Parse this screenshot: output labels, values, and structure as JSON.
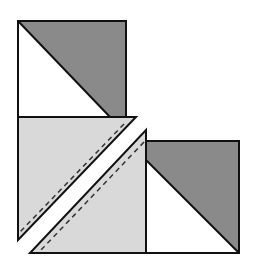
{
  "diagram": {
    "colors": {
      "background": "#ffffff",
      "outline": "#111111",
      "dark_fabric": "#8a8a8a",
      "light_fabric": "#d9d9d9",
      "white_fabric": "#ffffff",
      "seam_line": "#333333"
    },
    "pieces": [
      {
        "name": "top-square",
        "description": "Square split diagonally: white lower-left, dark upper-right"
      },
      {
        "name": "light-triangle-upper",
        "description": "Light triangle with dashed seam line along hypotenuse"
      },
      {
        "name": "light-triangle-lower",
        "description": "Light triangle with dashed seam line along hypotenuse"
      },
      {
        "name": "right-square",
        "description": "Square split diagonally: white lower-left, dark upper-right"
      }
    ]
  }
}
